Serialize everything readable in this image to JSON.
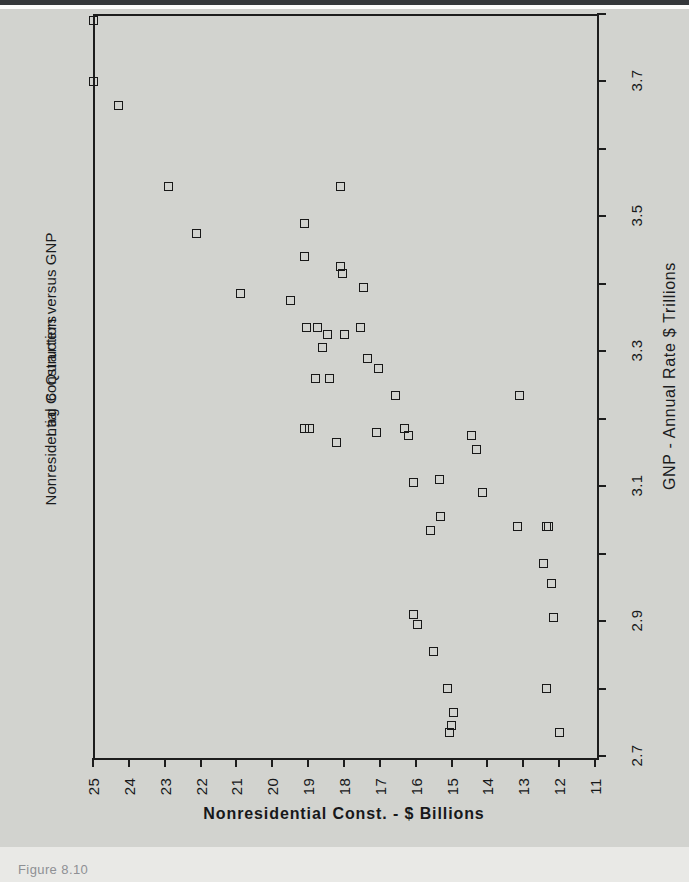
{
  "figure": {
    "caption": "Figure 8.10",
    "paper_color": "#d2d3cf",
    "ink_color": "#1d1d1d"
  },
  "chart_data": {
    "type": "scatter",
    "title": "Nonresidential Construction versus GNP",
    "subtitle": "Lag 6 Quarters",
    "orientation": "rotated-90",
    "xlabel": "Nonresidential Const. - $ Billions",
    "ylabel": "GNP - Annual Rate $ Trillions",
    "xlim": [
      25,
      11
    ],
    "ylim": [
      2.7,
      3.8
    ],
    "x_tick_labels": [
      "25",
      "24",
      "23",
      "22",
      "21",
      "20",
      "19",
      "18",
      "17",
      "16",
      "15",
      "14",
      "13",
      "12",
      "11"
    ],
    "x_ticks": [
      25,
      24,
      23,
      22,
      21,
      20,
      19,
      18,
      17,
      16,
      15,
      14,
      13,
      12,
      11
    ],
    "y_ticks": [
      2.7,
      2.8,
      2.9,
      3.0,
      3.1,
      3.2,
      3.3,
      3.4,
      3.5,
      3.6,
      3.7,
      3.8
    ],
    "y_tick_labels_shown": [
      "3.7",
      "3.5",
      "3.3",
      "3.1",
      "2.9",
      "2.7"
    ],
    "y_labeled_values": [
      3.7,
      3.5,
      3.3,
      3.1,
      2.9,
      2.7
    ],
    "grid": false,
    "legend": false,
    "marker": "open-square",
    "series_name": "Quarterly observations",
    "points": [
      {
        "construction": 25.0,
        "gnp": 3.79
      },
      {
        "construction": 25.0,
        "gnp": 3.7
      },
      {
        "construction": 24.3,
        "gnp": 3.665
      },
      {
        "construction": 22.9,
        "gnp": 3.545
      },
      {
        "construction": 22.1,
        "gnp": 3.475
      },
      {
        "construction": 20.9,
        "gnp": 3.385
      },
      {
        "construction": 19.5,
        "gnp": 3.375
      },
      {
        "construction": 19.1,
        "gnp": 3.49
      },
      {
        "construction": 19.1,
        "gnp": 3.44
      },
      {
        "construction": 19.05,
        "gnp": 3.335
      },
      {
        "construction": 18.75,
        "gnp": 3.335
      },
      {
        "construction": 18.6,
        "gnp": 3.305
      },
      {
        "construction": 18.45,
        "gnp": 3.325
      },
      {
        "construction": 18.4,
        "gnp": 3.26
      },
      {
        "construction": 18.1,
        "gnp": 3.545
      },
      {
        "construction": 18.1,
        "gnp": 3.425
      },
      {
        "construction": 18.05,
        "gnp": 3.415
      },
      {
        "construction": 18.0,
        "gnp": 3.325
      },
      {
        "construction": 18.8,
        "gnp": 3.26
      },
      {
        "construction": 19.1,
        "gnp": 3.185
      },
      {
        "construction": 18.95,
        "gnp": 3.185
      },
      {
        "construction": 18.2,
        "gnp": 3.165
      },
      {
        "construction": 17.45,
        "gnp": 3.395
      },
      {
        "construction": 17.35,
        "gnp": 3.29
      },
      {
        "construction": 17.55,
        "gnp": 3.335
      },
      {
        "construction": 17.05,
        "gnp": 3.275
      },
      {
        "construction": 17.1,
        "gnp": 3.18
      },
      {
        "construction": 16.55,
        "gnp": 3.235
      },
      {
        "construction": 16.3,
        "gnp": 3.185
      },
      {
        "construction": 16.2,
        "gnp": 3.175
      },
      {
        "construction": 16.05,
        "gnp": 3.105
      },
      {
        "construction": 16.05,
        "gnp": 2.91
      },
      {
        "construction": 15.95,
        "gnp": 2.895
      },
      {
        "construction": 15.6,
        "gnp": 3.035
      },
      {
        "construction": 15.5,
        "gnp": 2.855
      },
      {
        "construction": 15.35,
        "gnp": 3.11
      },
      {
        "construction": 15.3,
        "gnp": 3.055
      },
      {
        "construction": 15.1,
        "gnp": 2.8
      },
      {
        "construction": 14.95,
        "gnp": 2.765
      },
      {
        "construction": 15.0,
        "gnp": 2.745
      },
      {
        "construction": 15.05,
        "gnp": 2.735
      },
      {
        "construction": 14.45,
        "gnp": 3.175
      },
      {
        "construction": 14.3,
        "gnp": 3.155
      },
      {
        "construction": 14.15,
        "gnp": 3.09
      },
      {
        "construction": 13.1,
        "gnp": 3.235
      },
      {
        "construction": 13.15,
        "gnp": 3.04
      },
      {
        "construction": 12.45,
        "gnp": 2.985
      },
      {
        "construction": 12.3,
        "gnp": 3.04
      },
      {
        "construction": 12.35,
        "gnp": 3.04
      },
      {
        "construction": 12.2,
        "gnp": 2.955
      },
      {
        "construction": 12.15,
        "gnp": 2.905
      },
      {
        "construction": 12.35,
        "gnp": 2.8
      },
      {
        "construction": 12.0,
        "gnp": 2.735
      }
    ]
  }
}
